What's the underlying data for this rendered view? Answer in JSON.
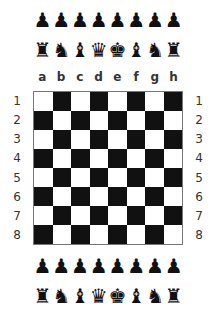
{
  "top_pieces": {
    "pawns": [
      "♟",
      "♟",
      "♟",
      "♟",
      "♟",
      "♟",
      "♟",
      "♟"
    ],
    "back_rank": [
      "♜",
      "♞",
      "♝",
      "♛",
      "♚",
      "♝",
      "♞",
      "♜"
    ]
  },
  "bottom_pieces": {
    "pawns": [
      "♟",
      "♟",
      "♟",
      "♟",
      "♟",
      "♟",
      "♟",
      "♟"
    ],
    "back_rank": [
      "♜",
      "♞",
      "♝",
      "♛",
      "♚",
      "♝",
      "♞",
      "♜"
    ]
  },
  "files": [
    "a",
    "b",
    "c",
    "d",
    "e",
    "f",
    "g",
    "h"
  ],
  "ranks": [
    "1",
    "2",
    "3",
    "4",
    "5",
    "6",
    "7",
    "8"
  ],
  "board": {
    "light_color": "#ffffff",
    "dark_color": "#111111",
    "first_square": "light"
  }
}
